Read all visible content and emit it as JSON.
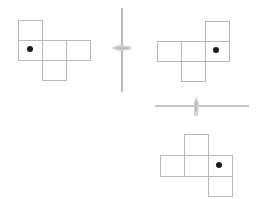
{
  "diagram": {
    "colors": {
      "background": "#ffffff",
      "cell_stroke": "#b8b8b8",
      "mirror_line": "#8a8a8a",
      "arrow": "#d0d0d0",
      "dot": "#1a1a1a"
    },
    "cell_size": 24,
    "nets": [
      {
        "id": "original",
        "cells": [
          {
            "x": 18,
            "y": 20
          },
          {
            "x": 18,
            "y": 40
          },
          {
            "x": 42,
            "y": 40
          },
          {
            "x": 66,
            "y": 40
          },
          {
            "x": 42,
            "y": 60
          }
        ],
        "dot": {
          "x": 30,
          "y": 49
        }
      },
      {
        "id": "reflected-vertical",
        "cells": [
          {
            "x": 205,
            "y": 21
          },
          {
            "x": 157,
            "y": 41
          },
          {
            "x": 181,
            "y": 41
          },
          {
            "x": 205,
            "y": 41
          },
          {
            "x": 181,
            "y": 61
          }
        ],
        "dot": {
          "x": 216,
          "y": 50
        }
      },
      {
        "id": "reflected-horizontal",
        "cells": [
          {
            "x": 184,
            "y": 134
          },
          {
            "x": 160,
            "y": 155
          },
          {
            "x": 184,
            "y": 155
          },
          {
            "x": 208,
            "y": 155
          },
          {
            "x": 208,
            "y": 176
          }
        ],
        "dot": {
          "x": 219,
          "y": 165
        }
      }
    ],
    "mirrors": [
      {
        "id": "vertical-mirror",
        "x1": 122,
        "y1": 8,
        "x2": 122,
        "y2": 92
      },
      {
        "id": "horizontal-mirror",
        "x1": 155,
        "y1": 106,
        "x2": 249,
        "y2": 106
      }
    ]
  }
}
